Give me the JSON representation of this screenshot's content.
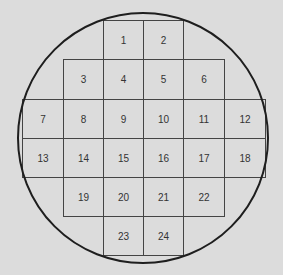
{
  "diagram": {
    "type": "wafer-die-map",
    "colors": {
      "background": "#dcdcdc",
      "outline": "#1e1e1e",
      "grid": "#444444",
      "text": "#333333"
    },
    "circle": {
      "cx": 143,
      "cy": 138,
      "r": 125
    },
    "cells": [
      {
        "label": "1",
        "x": 103,
        "y": 20,
        "w": 40,
        "h": 39
      },
      {
        "label": "2",
        "x": 143,
        "y": 20,
        "w": 40,
        "h": 39
      },
      {
        "label": "3",
        "x": 63,
        "y": 59,
        "w": 40,
        "h": 40
      },
      {
        "label": "4",
        "x": 103,
        "y": 59,
        "w": 40,
        "h": 40
      },
      {
        "label": "5",
        "x": 143,
        "y": 59,
        "w": 40,
        "h": 40
      },
      {
        "label": "6",
        "x": 183,
        "y": 59,
        "w": 41,
        "h": 40
      },
      {
        "label": "7",
        "x": 22,
        "y": 99,
        "w": 41,
        "h": 39
      },
      {
        "label": "8",
        "x": 63,
        "y": 99,
        "w": 40,
        "h": 39
      },
      {
        "label": "9",
        "x": 103,
        "y": 99,
        "w": 40,
        "h": 39
      },
      {
        "label": "10",
        "x": 143,
        "y": 99,
        "w": 40,
        "h": 39
      },
      {
        "label": "11",
        "x": 183,
        "y": 99,
        "w": 41,
        "h": 39
      },
      {
        "label": "12",
        "x": 224,
        "y": 99,
        "w": 41,
        "h": 39
      },
      {
        "label": "13",
        "x": 22,
        "y": 138,
        "w": 41,
        "h": 39
      },
      {
        "label": "14",
        "x": 63,
        "y": 138,
        "w": 40,
        "h": 39
      },
      {
        "label": "15",
        "x": 103,
        "y": 138,
        "w": 40,
        "h": 39
      },
      {
        "label": "16",
        "x": 143,
        "y": 138,
        "w": 40,
        "h": 39
      },
      {
        "label": "17",
        "x": 183,
        "y": 138,
        "w": 41,
        "h": 39
      },
      {
        "label": "18",
        "x": 224,
        "y": 138,
        "w": 41,
        "h": 39
      },
      {
        "label": "19",
        "x": 63,
        "y": 177,
        "w": 40,
        "h": 39
      },
      {
        "label": "20",
        "x": 103,
        "y": 177,
        "w": 40,
        "h": 39
      },
      {
        "label": "21",
        "x": 143,
        "y": 177,
        "w": 40,
        "h": 39
      },
      {
        "label": "22",
        "x": 183,
        "y": 177,
        "w": 41,
        "h": 39
      },
      {
        "label": "23",
        "x": 103,
        "y": 216,
        "w": 40,
        "h": 39
      },
      {
        "label": "24",
        "x": 143,
        "y": 216,
        "w": 40,
        "h": 39
      }
    ]
  }
}
